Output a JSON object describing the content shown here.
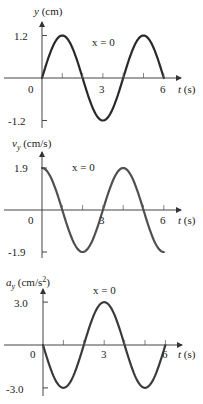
{
  "chart_data": [
    {
      "type": "line",
      "title": "",
      "ylabel": "y (cm)",
      "ylabel_var": "y",
      "ylabel_unit": " (cm)",
      "xlabel": "t (s)",
      "xlabel_var": "t",
      "xlabel_unit": " (s)",
      "annotation": "x = 0",
      "xlim": [
        0,
        6
      ],
      "ylim": [
        -1.2,
        1.2
      ],
      "x_ticks": [
        0,
        1,
        2,
        3,
        4,
        5,
        6
      ],
      "x_tick_labels": [
        "0",
        "3",
        "6"
      ],
      "y_tick_labels": [
        "1.2",
        "-1.2"
      ],
      "function": "y = 1.2 sin(pi t / 2)",
      "amplitude": 1.2,
      "phase": "sin",
      "x": [
        0,
        0.5,
        1,
        1.5,
        2,
        2.5,
        3,
        3.5,
        4,
        4.5,
        5,
        5.5,
        6
      ],
      "values": [
        0,
        0.85,
        1.2,
        0.85,
        0,
        -0.85,
        -1.2,
        -0.85,
        0,
        0.85,
        1.2,
        0.85,
        0
      ],
      "grid": false
    },
    {
      "type": "line",
      "title": "",
      "ylabel": "v_y (cm/s)",
      "ylabel_var": "v",
      "ylabel_sub": "y",
      "ylabel_unit": " (cm/s)",
      "xlabel": "t (s)",
      "xlabel_var": "t",
      "xlabel_unit": " (s)",
      "annotation": "x = 0",
      "xlim": [
        0,
        6
      ],
      "ylim": [
        -1.9,
        1.9
      ],
      "x_ticks": [
        0,
        1,
        2,
        3,
        4,
        5,
        6
      ],
      "x_tick_labels": [
        "0",
        "3",
        "6"
      ],
      "y_tick_labels": [
        "1.9",
        "-1.9"
      ],
      "function": "v_y = 1.9 cos(pi t / 2)",
      "amplitude": 1.9,
      "phase": "cos",
      "x": [
        0,
        0.5,
        1,
        1.5,
        2,
        2.5,
        3,
        3.5,
        4,
        4.5,
        5,
        5.5,
        6
      ],
      "values": [
        1.9,
        1.34,
        0,
        -1.34,
        -1.9,
        -1.34,
        0,
        1.34,
        1.9,
        1.34,
        0,
        -1.34,
        -1.9
      ],
      "grid": false
    },
    {
      "type": "line",
      "title": "",
      "ylabel": "a_y (cm/s^2)",
      "ylabel_var": "a",
      "ylabel_sub": "y",
      "ylabel_unit": " (cm/s",
      "ylabel_sup": "2",
      "ylabel_close": ")",
      "xlabel": "t (s)",
      "xlabel_var": "t",
      "xlabel_unit": " (s)",
      "annotation": "x = 0",
      "xlim": [
        0,
        6
      ],
      "ylim": [
        -3.0,
        3.0
      ],
      "x_ticks": [
        0,
        1,
        2,
        3,
        4,
        5,
        6
      ],
      "x_tick_labels": [
        "0",
        "3",
        "6"
      ],
      "y_tick_labels": [
        "3.0",
        "-3.0"
      ],
      "function": "a_y = -3.0 sin(pi t / 2)",
      "amplitude": -3.0,
      "phase": "sin",
      "x": [
        0,
        0.5,
        1,
        1.5,
        2,
        2.5,
        3,
        3.5,
        4,
        4.5,
        5,
        5.5,
        6
      ],
      "values": [
        0,
        -2.12,
        -3.0,
        -2.12,
        0,
        2.12,
        3.0,
        2.12,
        0,
        -2.12,
        -3.0,
        -2.12,
        0
      ],
      "grid": false
    }
  ],
  "layout": [
    {
      "ox": 42,
      "oy": 78,
      "sx": 20.3,
      "ppu": 35.4,
      "ytop": 22,
      "ybot": 128,
      "xend": 181,
      "curve_color": "#2a2a2a",
      "ylab_x": 34,
      "ylab_y": 14,
      "ann_x": 92,
      "ann_y": 46,
      "tlab_x": 178,
      "tlab_y": 92
    },
    {
      "ox": 42,
      "oy": 210,
      "sx": 20.3,
      "ppu": 22.1,
      "ytop": 152,
      "ybot": 258,
      "xend": 181,
      "curve_color": "#505050",
      "ylab_x": 12,
      "ylab_y": 147,
      "ann_x": 72,
      "ann_y": 171,
      "tlab_x": 178,
      "tlab_y": 224
    },
    {
      "ox": 43,
      "oy": 345,
      "sx": 20.4,
      "ppu": 14.3,
      "ytop": 289,
      "ybot": 396,
      "xend": 182,
      "curve_color": "#3a3a3a",
      "ylab_x": 6,
      "ylab_y": 286,
      "ann_x": 93,
      "ann_y": 294,
      "tlab_x": 178,
      "tlab_y": 360
    }
  ]
}
